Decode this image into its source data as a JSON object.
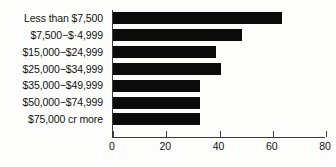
{
  "chart_data": {
    "type": "bar",
    "orientation": "horizontal",
    "title": "",
    "subtitle": "",
    "xlabel": "",
    "ylabel": "",
    "categories": [
      "Less than $7,500",
      "$7,500−$·4,999",
      "$15,000−$24,999",
      "$25,000−$34,999",
      "$35,000−$49,999",
      "$50,000−$74,999",
      "$75,000 cr more"
    ],
    "values": [
      64,
      49,
      39,
      41,
      33,
      33,
      33
    ],
    "xlim": [
      0,
      80
    ],
    "ylim": null,
    "xticks": [
      "0",
      "20",
      "40",
      "60",
      "80"
    ],
    "xtick_values": [
      0,
      20,
      40,
      60,
      80
    ],
    "grid": false,
    "legend": null,
    "bar_color": "#0b0b0b",
    "axis_color": "#3a3a3a",
    "background_color": "#fdfdfc"
  }
}
